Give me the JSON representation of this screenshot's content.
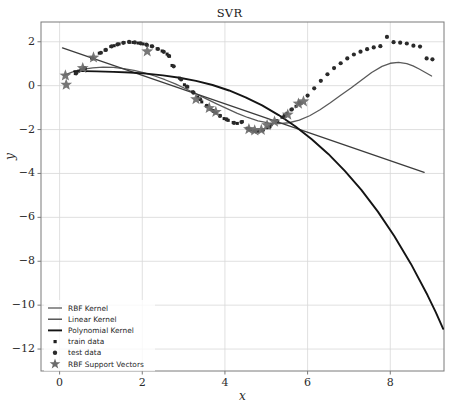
{
  "chart_data": {
    "type": "line",
    "title": "SVR",
    "xlabel": "x",
    "ylabel": "y",
    "xlim": [
      -0.45,
      9.3
    ],
    "ylim": [
      -13.0,
      2.9
    ],
    "xticks": [
      0,
      2,
      4,
      6,
      8
    ],
    "yticks": [
      2,
      0,
      -2,
      -4,
      -6,
      -8,
      -10,
      -12
    ],
    "xtick_labels": [
      "0",
      "2",
      "4",
      "6",
      "8"
    ],
    "ytick_labels": [
      "2",
      "0",
      "−2",
      "−4",
      "−6",
      "−8",
      "−10",
      "−12"
    ],
    "grid": true,
    "legend_position": "lower left",
    "series": [
      {
        "name": "RBF Kernel",
        "type": "line",
        "color": "#5a5a5a",
        "points": [
          [
            0.1,
            0.47
          ],
          [
            0.3,
            0.62
          ],
          [
            0.55,
            0.74
          ],
          [
            0.8,
            0.81
          ],
          [
            1.05,
            0.84
          ],
          [
            1.3,
            0.83
          ],
          [
            1.55,
            0.78
          ],
          [
            1.8,
            0.7
          ],
          [
            2.05,
            0.58
          ],
          [
            2.3,
            0.44
          ],
          [
            2.55,
            0.27
          ],
          [
            2.8,
            0.08
          ],
          [
            3.05,
            -0.14
          ],
          [
            3.3,
            -0.37
          ],
          [
            3.55,
            -0.6
          ],
          [
            3.8,
            -0.83
          ],
          [
            4.05,
            -1.05
          ],
          [
            4.3,
            -1.26
          ],
          [
            4.55,
            -1.45
          ],
          [
            4.8,
            -1.6
          ],
          [
            5.05,
            -1.7
          ],
          [
            5.3,
            -1.73
          ],
          [
            5.55,
            -1.69
          ],
          [
            5.8,
            -1.57
          ],
          [
            6.05,
            -1.37
          ],
          [
            6.3,
            -1.1
          ],
          [
            6.55,
            -0.78
          ],
          [
            6.8,
            -0.44
          ],
          [
            7.05,
            -0.11
          ],
          [
            7.3,
            0.25
          ],
          [
            7.55,
            0.6
          ],
          [
            7.8,
            0.88
          ],
          [
            8.0,
            1.02
          ],
          [
            8.2,
            1.06
          ],
          [
            8.4,
            1.0
          ],
          [
            8.55,
            0.9
          ],
          [
            8.7,
            0.76
          ],
          [
            8.85,
            0.6
          ],
          [
            9.0,
            0.44
          ]
        ]
      },
      {
        "name": "Linear Kernel",
        "type": "line",
        "color": "#3c3c3c",
        "points": [
          [
            0.07,
            1.72
          ],
          [
            8.82,
            -3.95
          ]
        ]
      },
      {
        "name": "Polynomial Kernel",
        "type": "line",
        "color": "#141414",
        "points": [
          [
            0.35,
            0.66
          ],
          [
            0.6,
            0.66
          ],
          [
            0.9,
            0.65
          ],
          [
            1.3,
            0.63
          ],
          [
            1.7,
            0.6
          ],
          [
            2.1,
            0.55
          ],
          [
            2.5,
            0.47
          ],
          [
            2.9,
            0.36
          ],
          [
            3.3,
            0.22
          ],
          [
            3.7,
            0.03
          ],
          [
            4.1,
            -0.22
          ],
          [
            4.5,
            -0.53
          ],
          [
            4.9,
            -0.9
          ],
          [
            5.3,
            -1.34
          ],
          [
            5.7,
            -1.85
          ],
          [
            6.1,
            -2.44
          ],
          [
            6.5,
            -3.11
          ],
          [
            6.9,
            -3.88
          ],
          [
            7.3,
            -4.75
          ],
          [
            7.7,
            -5.74
          ],
          [
            8.1,
            -6.86
          ],
          [
            8.5,
            -8.12
          ],
          [
            8.9,
            -9.54
          ],
          [
            9.1,
            -10.32
          ],
          [
            9.28,
            -11.08
          ]
        ]
      }
    ],
    "train_data": {
      "name": "train data",
      "marker": "square",
      "color": "#1f1f1f",
      "points": [
        [
          0.38,
          0.55
        ],
        [
          0.46,
          0.66
        ],
        [
          0.52,
          0.72
        ],
        [
          0.62,
          0.78
        ],
        [
          0.78,
          1.25
        ],
        [
          0.96,
          1.48
        ],
        [
          1.1,
          1.62
        ],
        [
          1.24,
          1.78
        ],
        [
          1.32,
          1.82
        ],
        [
          1.44,
          1.9
        ],
        [
          1.56,
          1.96
        ],
        [
          1.7,
          1.98
        ],
        [
          1.78,
          1.97
        ],
        [
          1.9,
          1.94
        ],
        [
          2.02,
          1.9
        ],
        [
          2.12,
          1.84
        ],
        [
          2.22,
          1.8
        ],
        [
          2.36,
          1.68
        ],
        [
          2.48,
          1.58
        ],
        [
          2.6,
          1.44
        ],
        [
          2.66,
          1.34
        ],
        [
          2.72,
          0.92
        ],
        [
          2.9,
          0.34
        ],
        [
          3.02,
          0.04
        ],
        [
          3.1,
          -0.06
        ],
        [
          3.22,
          -0.28
        ],
        [
          3.34,
          -0.52
        ],
        [
          3.44,
          -0.74
        ],
        [
          3.56,
          -0.92
        ],
        [
          3.66,
          -1.08
        ],
        [
          3.78,
          -1.24
        ],
        [
          3.88,
          -1.36
        ],
        [
          3.98,
          -1.5
        ],
        [
          4.08,
          -1.58
        ],
        [
          4.2,
          -1.68
        ],
        [
          4.3,
          -1.72
        ],
        [
          4.42,
          -1.64
        ],
        [
          4.54,
          -1.94
        ],
        [
          4.62,
          -2.02
        ],
        [
          4.7,
          -2.06
        ],
        [
          4.8,
          -2.08
        ],
        [
          4.9,
          -2.04
        ],
        [
          5.02,
          -1.92
        ],
        [
          5.12,
          -1.78
        ],
        [
          5.24,
          -1.62
        ],
        [
          5.38,
          -1.44
        ],
        [
          5.5,
          -1.26
        ],
        [
          5.6,
          -1.1
        ],
        [
          5.72,
          -0.94
        ],
        [
          5.84,
          -0.8
        ]
      ]
    },
    "test_data": {
      "name": "test data",
      "marker": "circle",
      "color": "#2a2a2a",
      "points": [
        [
          0.4,
          0.56
        ],
        [
          0.6,
          0.8
        ],
        [
          0.8,
          1.24
        ],
        [
          1.0,
          1.5
        ],
        [
          1.12,
          1.63
        ],
        [
          1.26,
          1.79
        ],
        [
          1.4,
          1.88
        ],
        [
          1.54,
          1.95
        ],
        [
          1.68,
          1.99
        ],
        [
          1.82,
          1.97
        ],
        [
          1.96,
          1.93
        ],
        [
          2.1,
          1.87
        ],
        [
          2.24,
          1.79
        ],
        [
          2.38,
          1.67
        ],
        [
          2.52,
          1.54
        ],
        [
          2.64,
          1.36
        ],
        [
          2.76,
          0.88
        ],
        [
          2.94,
          0.28
        ],
        [
          3.08,
          -0.04
        ],
        [
          3.24,
          -0.32
        ],
        [
          3.4,
          -0.62
        ],
        [
          3.56,
          -0.92
        ],
        [
          3.72,
          -1.16
        ],
        [
          3.88,
          -1.38
        ],
        [
          4.04,
          -1.54
        ],
        [
          4.22,
          -1.7
        ],
        [
          4.4,
          -1.66
        ],
        [
          4.58,
          -1.98
        ],
        [
          4.74,
          -2.08
        ],
        [
          4.92,
          -2.02
        ],
        [
          5.08,
          -1.88
        ],
        [
          5.26,
          -1.62
        ],
        [
          5.44,
          -1.38
        ],
        [
          5.62,
          -1.08
        ],
        [
          5.8,
          -0.8
        ],
        [
          6.0,
          -0.45
        ],
        [
          6.16,
          -0.12
        ],
        [
          6.32,
          0.22
        ],
        [
          6.48,
          0.52
        ],
        [
          6.64,
          0.8
        ],
        [
          6.8,
          1.02
        ],
        [
          6.96,
          1.24
        ],
        [
          7.12,
          1.42
        ],
        [
          7.28,
          1.55
        ],
        [
          7.44,
          1.66
        ],
        [
          7.6,
          1.74
        ],
        [
          7.76,
          1.8
        ],
        [
          7.92,
          2.22
        ],
        [
          8.08,
          1.98
        ],
        [
          8.24,
          1.96
        ],
        [
          8.4,
          1.92
        ],
        [
          8.56,
          1.82
        ],
        [
          8.72,
          1.78
        ],
        [
          8.88,
          1.24
        ],
        [
          9.02,
          1.2
        ]
      ]
    },
    "support_vectors": {
      "name": "RBF Support Vectors",
      "marker": "star",
      "color": "#6b6b6b",
      "points": [
        [
          0.14,
          0.46
        ],
        [
          0.16,
          0.04
        ],
        [
          0.56,
          0.8
        ],
        [
          0.82,
          1.28
        ],
        [
          2.12,
          1.56
        ],
        [
          3.3,
          -0.62
        ],
        [
          3.62,
          -1.02
        ],
        [
          3.78,
          -1.2
        ],
        [
          4.58,
          -1.98
        ],
        [
          4.72,
          -2.04
        ],
        [
          4.88,
          -2.02
        ],
        [
          5.02,
          -1.8
        ],
        [
          5.2,
          -1.64
        ],
        [
          5.52,
          -1.32
        ],
        [
          5.78,
          -0.82
        ],
        [
          5.9,
          -0.72
        ]
      ]
    },
    "legend_entries": [
      {
        "label": "RBF Kernel",
        "marker": "line",
        "color": "#5a5a5a"
      },
      {
        "label": "Linear Kernel",
        "marker": "line",
        "color": "#3c3c3c"
      },
      {
        "label": "Polynomial Kernel",
        "marker": "line",
        "color": "#141414"
      },
      {
        "label": "train data",
        "marker": "square",
        "color": "#1f1f1f"
      },
      {
        "label": "test data",
        "marker": "circle",
        "color": "#2a2a2a"
      },
      {
        "label": "RBF Support Vectors",
        "marker": "star",
        "color": "#6b6b6b"
      }
    ]
  },
  "colors": {
    "background": "#ffffff",
    "axis": "#7a7a7a",
    "grid": "#d8d8d8",
    "text": "#2b2b2b"
  }
}
